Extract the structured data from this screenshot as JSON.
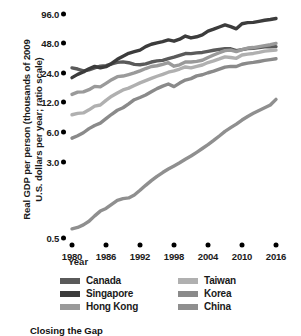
{
  "axis": {
    "ylabel": "Real GDP per person (thousands of 2009\nU.S. dollars per year; ratio scale)",
    "xlabel": "Year"
  },
  "caption": "Closing the Gap",
  "legend": {
    "items": [
      {
        "label": "Canada",
        "color": "#5a5a5a"
      },
      {
        "label": "Taiwan",
        "color": "#b0b0b0"
      },
      {
        "label": "Singapore",
        "color": "#3c3c3c"
      },
      {
        "label": "Korea",
        "color": "#8a8a8a"
      },
      {
        "label": "Hong Kong",
        "color": "#9a9a9a"
      },
      {
        "label": "China",
        "color": "#8f8f8f"
      }
    ]
  },
  "chart_data": {
    "type": "line",
    "title": "Closing the Gap",
    "xlabel": "Year",
    "ylabel": "Real GDP per person (thousands of 2009 U.S. dollars per year; ratio scale)",
    "yscale": "log",
    "ylim": [
      0.5,
      110
    ],
    "xlim": [
      1980,
      2016
    ],
    "yticks": [
      0.5,
      3.0,
      6.0,
      12.0,
      24.0,
      48.0,
      96.0
    ],
    "ytick_labels": [
      "0.5",
      "3.0",
      "6.0",
      "12.0",
      "24.0",
      "48.0",
      "96.0"
    ],
    "xticks": [
      1980,
      1986,
      1992,
      1998,
      2004,
      2010,
      2016
    ],
    "xtick_labels": [
      "1980",
      "1986",
      "1992",
      "1998",
      "2004",
      "2010",
      "2016"
    ],
    "grid": false,
    "legend_position": "bottom",
    "x": [
      1980,
      1981,
      1982,
      1983,
      1984,
      1985,
      1986,
      1987,
      1988,
      1989,
      1990,
      1991,
      1992,
      1993,
      1994,
      1995,
      1996,
      1997,
      1998,
      1999,
      2000,
      2001,
      2002,
      2003,
      2004,
      2005,
      2006,
      2007,
      2008,
      2009,
      2010,
      2011,
      2012,
      2013,
      2014,
      2015,
      2016
    ],
    "series": [
      {
        "name": "Canada",
        "color": "#5a5a5a",
        "values": [
          27.0,
          26.3,
          25.2,
          25.8,
          27.0,
          28.1,
          28.5,
          29.6,
          30.7,
          31.1,
          30.5,
          29.3,
          29.1,
          29.7,
          31.0,
          31.8,
          32.2,
          33.5,
          34.7,
          36.3,
          37.8,
          37.7,
          38.4,
          38.8,
          39.8,
          40.8,
          41.7,
          42.4,
          42.3,
          40.5,
          41.5,
          42.4,
          42.8,
          43.4,
          44.3,
          44.2,
          44.5
        ]
      },
      {
        "name": "Singapore",
        "color": "#3c3c3c",
        "values": [
          21.5,
          23.2,
          24.5,
          26.5,
          28.0,
          27.0,
          27.8,
          30.0,
          33.0,
          35.5,
          38.0,
          39.5,
          41.0,
          44.5,
          47.0,
          48.5,
          50.0,
          52.0,
          50.5,
          53.0,
          57.0,
          54.5,
          56.0,
          58.5,
          64.0,
          67.0,
          70.5,
          74.0,
          71.0,
          67.5,
          76.0,
          78.0,
          78.5,
          80.5,
          82.5,
          84.0,
          86.0
        ]
      },
      {
        "name": "Hong Kong",
        "color": "#9a9a9a",
        "values": [
          14.5,
          15.3,
          15.4,
          16.2,
          17.5,
          17.3,
          18.8,
          20.5,
          22.0,
          22.3,
          23.1,
          24.0,
          25.2,
          26.6,
          27.9,
          28.4,
          29.3,
          30.5,
          28.1,
          29.0,
          31.0,
          31.0,
          31.5,
          32.3,
          34.5,
          36.5,
          38.5,
          40.5,
          41.0,
          39.5,
          41.5,
          43.0,
          43.5,
          44.5,
          45.5,
          46.5,
          48.0
        ]
      },
      {
        "name": "Taiwan",
        "color": "#b0b0b0",
        "values": [
          9.0,
          9.3,
          9.4,
          10.1,
          11.0,
          11.3,
          12.6,
          13.9,
          15.0,
          16.1,
          16.8,
          17.9,
          19.0,
          20.0,
          21.1,
          22.2,
          23.2,
          24.4,
          25.2,
          26.3,
          27.6,
          27.0,
          28.0,
          28.9,
          30.6,
          31.8,
          33.3,
          35.0,
          34.5,
          33.8,
          36.5,
          37.3,
          37.9,
          38.8,
          40.0,
          40.5,
          41.0
        ]
      },
      {
        "name": "Korea",
        "color": "#8a8a8a",
        "values": [
          5.2,
          5.5,
          5.9,
          6.5,
          7.0,
          7.4,
          8.2,
          9.1,
          10.0,
          10.6,
          11.6,
          12.8,
          13.5,
          14.3,
          15.4,
          16.6,
          17.6,
          18.5,
          17.4,
          18.9,
          20.3,
          21.0,
          22.4,
          23.0,
          24.1,
          25.0,
          26.2,
          27.5,
          28.0,
          27.9,
          29.4,
          30.2,
          30.7,
          31.4,
          32.2,
          32.8,
          33.5
        ]
      },
      {
        "name": "China",
        "color": "#8f8f8f",
        "values": [
          0.62,
          0.64,
          0.68,
          0.74,
          0.84,
          0.94,
          1.0,
          1.1,
          1.21,
          1.26,
          1.28,
          1.37,
          1.53,
          1.72,
          1.92,
          2.12,
          2.32,
          2.52,
          2.71,
          2.92,
          3.17,
          3.42,
          3.73,
          4.08,
          4.47,
          4.93,
          5.47,
          6.1,
          6.65,
          7.22,
          7.95,
          8.65,
          9.3,
          9.95,
          10.6,
          11.3,
          12.9
        ]
      }
    ]
  }
}
